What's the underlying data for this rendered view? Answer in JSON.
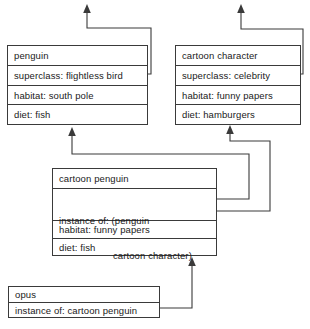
{
  "diagram": {
    "type": "frame-knowledge-representation",
    "frames": [
      {
        "id": "penguin",
        "name": "penguin",
        "slots": [
          {
            "label": "superclass: flightless bird",
            "link": true
          },
          {
            "label": "habitat: south pole",
            "link": false
          },
          {
            "label": "diet: fish",
            "link": false
          }
        ]
      },
      {
        "id": "cartoon-character",
        "name": "cartoon character",
        "slots": [
          {
            "label": "superclass: celebrity",
            "link": true
          },
          {
            "label": "habitat: funny papers",
            "link": false
          },
          {
            "label": "diet: hamburgers",
            "link": false
          }
        ]
      },
      {
        "id": "cartoon-penguin",
        "name": "cartoon penguin",
        "slots": [
          {
            "label": "instance of: (penguin",
            "label2": "cartoon character)",
            "link": true
          },
          {
            "label": "habitat: funny papers",
            "link": false
          },
          {
            "label": "diet: fish",
            "link": false
          }
        ]
      },
      {
        "id": "opus",
        "name": "opus",
        "slots": [
          {
            "label": "instance of: cartoon penguin",
            "link": true
          }
        ]
      }
    ],
    "edges": [
      {
        "from": "penguin.superclass",
        "to": "flightless-bird-offscreen"
      },
      {
        "from": "cartoon-character.superclass",
        "to": "celebrity-offscreen"
      },
      {
        "from": "cartoon-penguin.instance-of-penguin",
        "to": "penguin"
      },
      {
        "from": "cartoon-penguin.instance-of-cartoon-character",
        "to": "cartoon-character"
      },
      {
        "from": "opus.instance-of",
        "to": "cartoon-penguin"
      }
    ],
    "colors": {
      "stroke": "#3a3a3a",
      "background": "#ffffff",
      "text": "#1a1a1a"
    }
  }
}
